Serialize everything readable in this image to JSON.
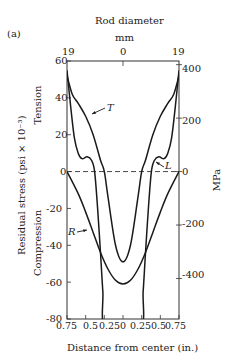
{
  "figure": {
    "panel_label": "(a)",
    "top_axis_title": "Rod diameter",
    "top_axis_unit": "mm",
    "top_ticks": [
      "19",
      "0",
      "19"
    ],
    "left_ticks": [
      "60",
      "40",
      "20",
      "0",
      "-20",
      "-40",
      "-60",
      "-80"
    ],
    "right_ticks": [
      "400",
      "200",
      "0",
      "-200",
      "-400"
    ],
    "bottom_ticks": [
      "0.75",
      "0.5",
      "0.25",
      "0",
      "0.25",
      "0.5",
      "0.75"
    ],
    "xlabel": "Distance from center (in.)",
    "ylabel": "Residual stress (psi × 10⁻³)",
    "ylabel_tension": "Tension",
    "ylabel_compression": "Compression",
    "right_ylabel": "MPa",
    "curve_labels": {
      "T": "T",
      "L": "L",
      "R": "R"
    }
  },
  "chart_data": {
    "type": "line",
    "title": "",
    "xlabel": "Distance from center (in.)",
    "ylabel": "Residual stress (psi × 10⁻³)",
    "secondary_ylabel": "MPa",
    "top_xlabel": "Rod diameter (mm)",
    "xlim": [
      -0.75,
      0.75
    ],
    "ylim": [
      -80,
      60
    ],
    "secondary_ylim_ticks": [
      400,
      200,
      0,
      -200,
      -400
    ],
    "x_tick_labels": [
      "0.75",
      "0.5",
      "0.25",
      "0",
      "0.25",
      "0.5",
      "0.75"
    ],
    "y_ticks": [
      60,
      40,
      20,
      0,
      -20,
      -40,
      -60,
      -80
    ],
    "grid": false,
    "reference_line": {
      "y": 0,
      "style": "dashed"
    },
    "series": [
      {
        "name": "T",
        "x": [
          -0.75,
          -0.68,
          -0.6,
          -0.5,
          -0.4,
          -0.3,
          -0.25,
          -0.2,
          -0.1,
          0,
          0.1,
          0.2,
          0.25,
          0.3,
          0.4,
          0.5,
          0.6,
          0.68,
          0.75
        ],
        "y": [
          52,
          42,
          37,
          30,
          20,
          6,
          0,
          -14,
          -40,
          -49,
          -40,
          -14,
          0,
          6,
          20,
          30,
          37,
          42,
          52
        ]
      },
      {
        "name": "L",
        "x": [
          -0.75,
          -0.7,
          -0.65,
          -0.6,
          -0.55,
          -0.48,
          -0.42,
          -0.38,
          -0.34,
          -0.3,
          -0.27,
          -0.23,
          0.23,
          0.27,
          0.3,
          0.34,
          0.38,
          0.42,
          0.48,
          0.55,
          0.6,
          0.65,
          0.7,
          0.75
        ],
        "y": [
          55,
          35,
          18,
          10,
          7,
          8,
          6,
          0,
          -20,
          -45,
          -65,
          -85,
          -85,
          -65,
          -45,
          -20,
          0,
          6,
          8,
          7,
          10,
          18,
          35,
          55
        ]
      },
      {
        "name": "R",
        "x": [
          -0.75,
          -0.6,
          -0.5,
          -0.4,
          -0.3,
          -0.2,
          -0.1,
          0,
          0.1,
          0.2,
          0.3,
          0.4,
          0.5,
          0.6,
          0.75
        ],
        "y": [
          0,
          -12,
          -22,
          -33,
          -44,
          -53,
          -59,
          -61,
          -59,
          -53,
          -44,
          -33,
          -22,
          -12,
          0
        ]
      }
    ],
    "annotations": [
      {
        "text": "T",
        "x": -0.35,
        "y": 35
      },
      {
        "text": "L",
        "x": 0.65,
        "y": 3
      },
      {
        "text": "R",
        "x": -0.65,
        "y": -33
      }
    ]
  }
}
